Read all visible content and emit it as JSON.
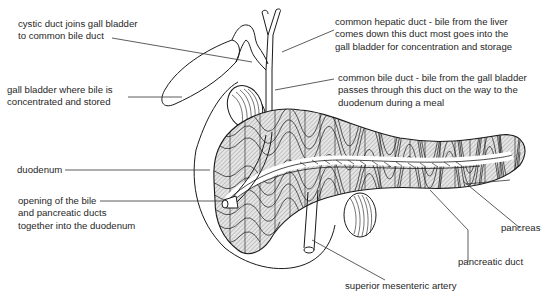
{
  "diagram": {
    "labels": {
      "cystic_duct": [
        "cystic duct joins gall bladder",
        "to common bile duct"
      ],
      "gall_bladder": [
        "gall bladder where bile is",
        "concentrated and stored"
      ],
      "duodenum": [
        "duodenum"
      ],
      "opening": [
        "opening of the bile",
        "and pancreatic ducts",
        "together into the duodenum"
      ],
      "common_hepatic_duct": [
        "common hepatic duct  -  bile from the liver",
        "comes down this duct   most goes into the",
        "gall bladder for concentration and storage"
      ],
      "common_bile_duct": [
        "common bile duct  -  bile from the gall bladder",
        "passes through this duct on the way to the",
        "duodenum during a meal"
      ],
      "pancreas": [
        "pancreas"
      ],
      "pancreatic_duct": [
        "pancreatic duct"
      ],
      "superior_mesenteric_artery": [
        "superior mesenteric artery"
      ]
    },
    "colors": {
      "line": "#1a1a1a",
      "lobule_fill": "#cfcfcf",
      "background": "#ffffff"
    }
  }
}
